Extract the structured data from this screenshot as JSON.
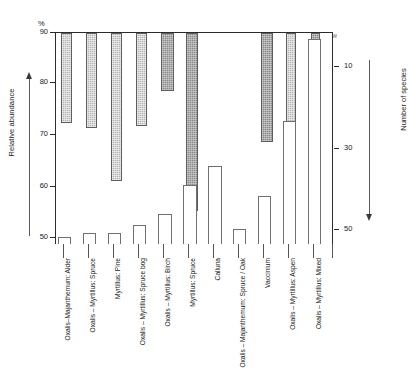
{
  "axes": {
    "percent_symbol": "%",
    "left_label": "Relative abundance",
    "right_label": "Number of species",
    "left_ticks": [
      "90",
      "80",
      "70",
      "60",
      "50"
    ],
    "right_ticks": [
      "0",
      "10",
      "30",
      "50"
    ],
    "right_break_symbol": "≈"
  },
  "chart_data": {
    "type": "bar",
    "title": "",
    "subtitle": "",
    "xlabel": "",
    "ylabel": "Relative abundance",
    "y2label": "Number of species",
    "ylim": [
      50,
      90
    ],
    "y2lim": [
      0,
      57
    ],
    "y2_inverted": true,
    "grid": false,
    "legend": null,
    "categories": [
      "Oxalis–Majanthemum: Alder",
      "Oxalis – Myrtillus: Spruce",
      "Myrtillus: Pine",
      "Oxalis – Myrtillus: Spruce bog",
      "Oxalis – Myrtillus: Birch",
      "Myrtillus: Spruce",
      "Calluna",
      "Oxalis – Majanthemum: Spruce / Oak",
      "Vaccinium",
      "Oxalis – Myrtillus: Aspen",
      "Oxalis – Myrtillus: Mixed"
    ],
    "series": [
      {
        "name": "Relative abundance",
        "axis": "left",
        "unit": "%",
        "shading": [
          "light",
          "light",
          "light",
          "light",
          "dark",
          "dark",
          "none",
          "light",
          "dark",
          "light",
          "dark"
        ],
        "values": [
          73,
          72,
          62,
          72.5,
          79,
          56.5,
          null,
          69.5,
          59.5,
          80,
          87.5
        ]
      },
      {
        "name": "Number of species",
        "axis": "right",
        "unit": "species",
        "values": [
          55,
          54,
          54,
          52,
          49,
          41,
          36,
          53,
          44,
          24,
          2
        ]
      }
    ]
  }
}
